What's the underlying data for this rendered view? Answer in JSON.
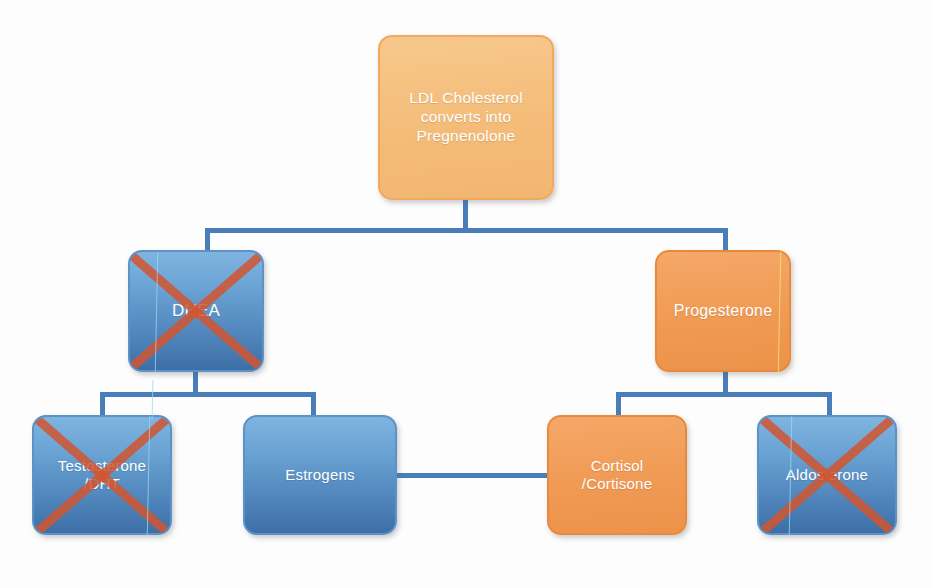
{
  "diagram": {
    "type": "flowchart",
    "colors": {
      "orange_light": "#F4BC78",
      "orange": "#F09A54",
      "blue_light": "#7FB4DF",
      "blue_dark": "#3D6FA6",
      "connector": "#4A7EBB",
      "x_mark": "#D2552F",
      "label_text": "#FFFFFF",
      "background": "#FDFDFD"
    },
    "nodes": [
      {
        "id": "ldl",
        "label": "LDL Cholesterol\nconverts into\nPregnenolone",
        "color": "orange-light",
        "crossed_out": false,
        "level": 0
      },
      {
        "id": "dhea",
        "label": "DHEA",
        "color": "blue",
        "crossed_out": true,
        "level": 1
      },
      {
        "id": "progesterone",
        "label": "Progesterone",
        "color": "orange",
        "crossed_out": false,
        "level": 1
      },
      {
        "id": "testosterone",
        "label": "Testosterone\n/DHT",
        "color": "blue",
        "crossed_out": true,
        "level": 2
      },
      {
        "id": "estrogens",
        "label": "Estrogens",
        "color": "blue",
        "crossed_out": false,
        "level": 2
      },
      {
        "id": "cortisol",
        "label": "Cortisol\n/Cortisone",
        "color": "orange",
        "crossed_out": false,
        "level": 2
      },
      {
        "id": "aldosterone",
        "label": "Aldosterone",
        "color": "blue",
        "crossed_out": true,
        "level": 2
      }
    ],
    "edges": [
      {
        "from": "ldl",
        "to": "dhea"
      },
      {
        "from": "ldl",
        "to": "progesterone"
      },
      {
        "from": "dhea",
        "to": "testosterone"
      },
      {
        "from": "dhea",
        "to": "estrogens"
      },
      {
        "from": "progesterone",
        "to": "cortisol"
      },
      {
        "from": "progesterone",
        "to": "aldosterone"
      },
      {
        "from": "estrogens",
        "to": "cortisol"
      }
    ],
    "ghost_text": "…"
  }
}
